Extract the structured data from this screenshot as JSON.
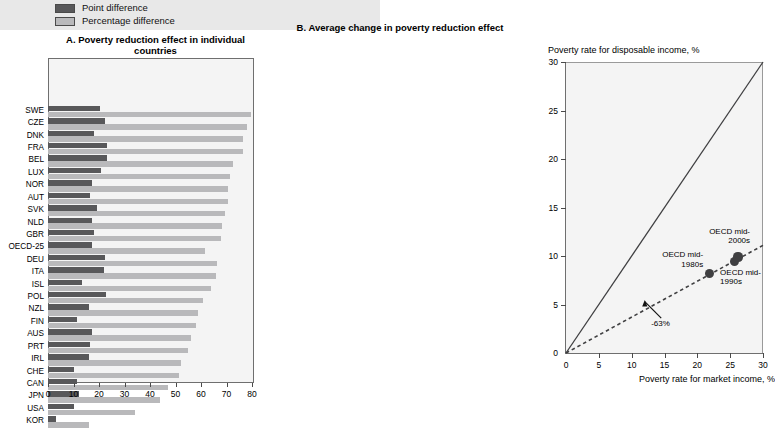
{
  "legend": {
    "items": [
      {
        "name": "point-difference",
        "label": "Point difference",
        "color": "#58585a"
      },
      {
        "name": "percentage-difference",
        "label": "Percentage difference",
        "color": "#b9b9bb"
      }
    ]
  },
  "panel_a": {
    "title": "A. Poverty reduction effect in individual countries"
  },
  "panel_b": {
    "title": "B. Average change in poverty reduction effect",
    "ylabel": "Poverty rate for disposable income, %",
    "xlabel": "Poverty rate for market income, %"
  },
  "chart_data": [
    {
      "type": "bar",
      "id": "panel-a",
      "title": "A. Poverty reduction effect in individual countries",
      "orientation": "horizontal",
      "xlabel": "",
      "ylabel": "",
      "xlim": [
        0,
        80
      ],
      "xticks": [
        0,
        10,
        20,
        30,
        40,
        50,
        60,
        70,
        80
      ],
      "grid": false,
      "legend_position": "top-left",
      "categories": [
        "SWE",
        "CZE",
        "DNK",
        "FRA",
        "BEL",
        "LUX",
        "NOR",
        "AUT",
        "SVK",
        "NLD",
        "GBR",
        "OECD-25",
        "DEU",
        "ITA",
        "ISL",
        "POL",
        "NZL",
        "FIN",
        "AUS",
        "PRT",
        "IRL",
        "CHE",
        "CAN",
        "JPN",
        "USA",
        "KOR"
      ],
      "series": [
        {
          "name": "Point difference",
          "color": "#58585a",
          "values": [
            20.5,
            22.4,
            18.0,
            23.0,
            23.2,
            20.6,
            17.3,
            16.6,
            19.1,
            17.1,
            18.0,
            17.1,
            22.2,
            21.8,
            13.2,
            22.6,
            16.1,
            11.3,
            17.1,
            16.6,
            16.2,
            10.0,
            11.4,
            12.0,
            10.1,
            3.0
          ]
        },
        {
          "name": "Percentage difference",
          "color": "#b9b9bb",
          "values": [
            79.5,
            78.0,
            76.5,
            76.4,
            72.5,
            71.5,
            70.5,
            70.4,
            69.3,
            68.3,
            67.8,
            61.5,
            66.4,
            65.7,
            64.0,
            60.6,
            59.0,
            58.0,
            56.0,
            55.0,
            52.0,
            51.4,
            47.2,
            44.0,
            34.0,
            16.0
          ]
        }
      ]
    },
    {
      "type": "scatter",
      "id": "panel-b",
      "title": "B. Average change in poverty reduction effect",
      "xlabel": "Poverty rate for market income, %",
      "ylabel": "Poverty rate for disposable income, %",
      "xlim": [
        0,
        30
      ],
      "ylim": [
        0,
        30
      ],
      "xticks": [
        0,
        5,
        10,
        15,
        20,
        25,
        30
      ],
      "yticks": [
        0,
        5,
        10,
        15,
        20,
        25,
        30
      ],
      "grid": false,
      "points": [
        {
          "label": "OECD mid-1980s",
          "label_line1": "OECD mid-",
          "label_line2": "1980s",
          "x": 21.8,
          "y": 8.2
        },
        {
          "label": "OECD mid-1990s",
          "label_line1": "OECD mid-",
          "label_line2": "1990s",
          "x": 25.6,
          "y": 9.4
        },
        {
          "label": "OECD mid-2000s",
          "label_line1": "OECD mid-",
          "label_line2": "2000s",
          "x": 26.2,
          "y": 9.9
        }
      ],
      "lines": [
        {
          "name": "45-degree line",
          "style": "solid",
          "from": [
            0,
            0
          ],
          "to": [
            30,
            30
          ]
        },
        {
          "name": "regression line",
          "style": "dashed",
          "from": [
            0,
            0
          ],
          "to": [
            30,
            11.1
          ],
          "slope": 0.37
        }
      ],
      "annotations": [
        {
          "name": "reduction-annotation",
          "text": "-63%",
          "x": 14.5,
          "y": 3.6,
          "arrow_to": [
            12.0,
            5.3
          ]
        }
      ]
    }
  ]
}
